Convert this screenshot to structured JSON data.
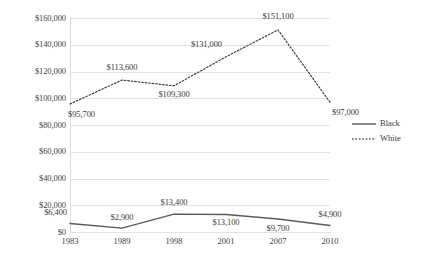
{
  "chart_data": {
    "type": "line",
    "title": "",
    "xlabel": "",
    "ylabel": "",
    "categories": [
      "1983",
      "1989",
      "1998",
      "2001",
      "2007",
      "2010"
    ],
    "ylim": [
      0,
      160000
    ],
    "ytick_step": 20000,
    "ytick_labels": [
      "$0",
      "$20,000",
      "$40,000",
      "$60,000",
      "$80,000",
      "$100,000",
      "$120,000",
      "$140,000",
      "$160,000"
    ],
    "ytick_values": [
      0,
      20000,
      40000,
      60000,
      80000,
      100000,
      120000,
      140000,
      160000
    ],
    "grid": true,
    "legend_position": "right",
    "series": [
      {
        "name": "Black",
        "style": "solid",
        "color": "#595959",
        "values": [
          6400,
          2900,
          13400,
          13100,
          9700,
          4900
        ],
        "labels": [
          "$6,400",
          "$2,900",
          "$13,400",
          "$13,100",
          "$9,700",
          "$4,900"
        ]
      },
      {
        "name": "White",
        "style": "dotted",
        "color": "#3f3f3f",
        "values": [
          95700,
          113600,
          109300,
          131000,
          151100,
          97000
        ],
        "labels": [
          "$95,700",
          "$113,600",
          "$109,300",
          "$131,000",
          "$151,100",
          "$97,000"
        ]
      }
    ]
  },
  "legend": {
    "items": [
      {
        "label": "Black",
        "style": "solid"
      },
      {
        "label": "White",
        "style": "dotted"
      }
    ]
  }
}
